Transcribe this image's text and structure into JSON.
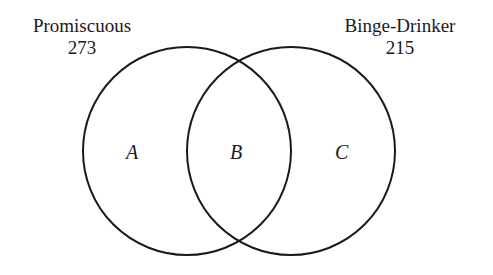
{
  "diagram": {
    "type": "venn",
    "sets": [
      {
        "name": "Promiscuous",
        "count": "273"
      },
      {
        "name": "Binge-Drinker",
        "count": "215"
      }
    ],
    "regions": [
      {
        "label": "A"
      },
      {
        "label": "B"
      },
      {
        "label": "C"
      }
    ],
    "stroke_color": "#1a1a1a"
  }
}
